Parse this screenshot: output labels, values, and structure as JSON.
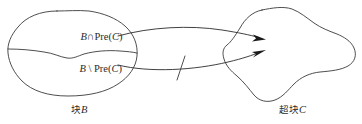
{
  "figure": {
    "type": "set-transition-diagram",
    "background_color": "#ffffff",
    "line_color": "#3a3a3a",
    "arrow_color": "#1a1a1a",
    "text_color": "#2b2b2b"
  },
  "left_region": {
    "name": "block-B",
    "caption": "块B",
    "upper_part_label": "B∩Pre(C)",
    "lower_part_label": "B \\ Pre(C)"
  },
  "right_region": {
    "name": "superblock-C",
    "caption": "超块C"
  },
  "arrows": [
    {
      "id": "upper-arrow",
      "from": "B∩Pre(C)",
      "to": "超块C",
      "crossed_out": false
    },
    {
      "id": "lower-arrow",
      "from": "B \\ Pre(C)",
      "to": "超块C",
      "crossed_out": true,
      "mark": "slash"
    }
  ]
}
